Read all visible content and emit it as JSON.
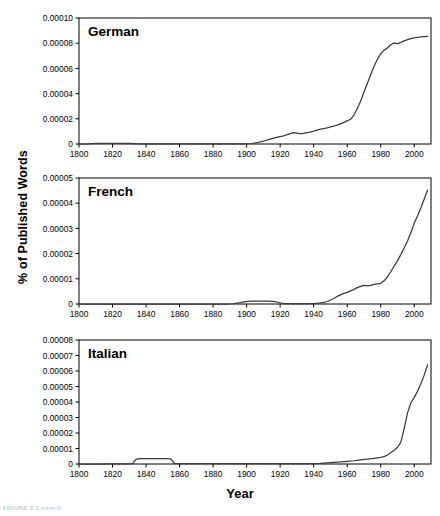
{
  "figure": {
    "caption": "FIGURE 2.1  cont'd",
    "ylabel": "% of Published Words",
    "xlabel": "Year"
  },
  "chart_data": [
    {
      "type": "line",
      "title": "German",
      "xlabel": "Year",
      "ylabel": "% of Published Words",
      "xlim": [
        1800,
        2010
      ],
      "ylim": [
        0,
        0.0001
      ],
      "xticks": [
        1800,
        1820,
        1840,
        1860,
        1880,
        1900,
        1920,
        1940,
        1960,
        1980,
        2000
      ],
      "xticklabels": [
        "1800",
        "1820",
        "1840",
        "1860",
        "1880",
        "1900",
        "1920",
        "1940",
        "1960",
        "1980",
        "2000"
      ],
      "yticks": [
        0,
        2e-05,
        4e-05,
        6e-05,
        8e-05,
        0.0001
      ],
      "yticklabels": [
        "0",
        "0.00002",
        "0.00004",
        "0.00006",
        "0.00008",
        "0.00010"
      ],
      "grid": false,
      "legend": null,
      "x": [
        1800,
        1805,
        1808,
        1810,
        1814,
        1818,
        1822,
        1826,
        1830,
        1833,
        1836,
        1840,
        1845,
        1850,
        1855,
        1860,
        1865,
        1870,
        1875,
        1880,
        1885,
        1890,
        1895,
        1900,
        1903,
        1906,
        1910,
        1914,
        1918,
        1922,
        1926,
        1928,
        1930,
        1932,
        1934,
        1936,
        1938,
        1940,
        1942,
        1944,
        1946,
        1948,
        1950,
        1952,
        1954,
        1956,
        1958,
        1960,
        1962,
        1964,
        1966,
        1968,
        1970,
        1972,
        1974,
        1976,
        1978,
        1980,
        1982,
        1984,
        1986,
        1988,
        1990,
        1992,
        1994,
        1996,
        1998,
        2000,
        2002,
        2004,
        2006,
        2008
      ],
      "y": [
        0.0,
        1e-07,
        4e-07,
        5e-07,
        5e-07,
        5e-07,
        5e-07,
        5e-07,
        5e-07,
        3e-07,
        1e-07,
        1e-07,
        1e-07,
        1e-07,
        1e-07,
        1e-07,
        1e-07,
        1e-07,
        1e-07,
        1e-07,
        1e-07,
        1e-07,
        1e-07,
        2e-07,
        4e-07,
        1e-06,
        2.2e-06,
        3.8e-06,
        5.2e-06,
        6.5e-06,
        8.2e-06,
        9e-06,
        8.6e-06,
        8.2e-06,
        8.4e-06,
        9e-06,
        9.5e-06,
        1.02e-05,
        1.1e-05,
        1.18e-05,
        1.22e-05,
        1.28e-05,
        1.36e-05,
        1.42e-05,
        1.5e-05,
        1.6e-05,
        1.72e-05,
        1.84e-05,
        1.96e-05,
        2.3e-05,
        2.8e-05,
        3.4e-05,
        4.1e-05,
        4.8e-05,
        5.5e-05,
        6.15e-05,
        6.72e-05,
        7.16e-05,
        7.45e-05,
        7.62e-05,
        7.9e-05,
        8e-05,
        7.96e-05,
        8.06e-05,
        8.18e-05,
        8.28e-05,
        8.36e-05,
        8.42e-05,
        8.46e-05,
        8.5e-05,
        8.52e-05,
        8.54e-05
      ]
    },
    {
      "type": "line",
      "title": "French",
      "xlabel": "Year",
      "ylabel": "% of Published Words",
      "xlim": [
        1800,
        2010
      ],
      "ylim": [
        0,
        5e-05
      ],
      "xticks": [
        1800,
        1820,
        1840,
        1860,
        1880,
        1900,
        1920,
        1940,
        1960,
        1980,
        2000
      ],
      "xticklabels": [
        "1800",
        "1820",
        "1840",
        "1860",
        "1880",
        "1900",
        "1920",
        "1940",
        "1960",
        "1980",
        "2000"
      ],
      "yticks": [
        0,
        1e-05,
        2e-05,
        3e-05,
        4e-05,
        5e-05
      ],
      "yticklabels": [
        "0",
        "0.00001",
        "0.00002",
        "0.00003",
        "0.00004",
        "0.00005"
      ],
      "grid": false,
      "legend": null,
      "x": [
        1800,
        1810,
        1820,
        1830,
        1840,
        1850,
        1860,
        1870,
        1880,
        1888,
        1892,
        1895,
        1898,
        1901,
        1904,
        1908,
        1912,
        1916,
        1918,
        1920,
        1922,
        1924,
        1928,
        1932,
        1936,
        1940,
        1943,
        1946,
        1948,
        1950,
        1952,
        1954,
        1956,
        1958,
        1960,
        1962,
        1964,
        1966,
        1968,
        1970,
        1972,
        1974,
        1976,
        1978,
        1980,
        1982,
        1984,
        1986,
        1988,
        1990,
        1992,
        1994,
        1996,
        1998,
        2000,
        2002,
        2004,
        2006,
        2008
      ],
      "y": [
        0.0,
        0.0,
        0.0,
        0.0,
        0.0,
        0.0,
        0.0,
        0.0,
        0.0,
        0.0,
        1e-07,
        4e-07,
        8e-07,
        1e-06,
        1.1e-06,
        1.1e-06,
        1.1e-06,
        1e-06,
        8e-07,
        4e-07,
        2e-07,
        2e-07,
        2e-07,
        2e-07,
        2e-07,
        2e-07,
        3e-07,
        6e-07,
        1e-06,
        1.6e-06,
        2.2e-06,
        3e-06,
        3.6e-06,
        4.2e-06,
        4.6e-06,
        5.2e-06,
        5.8e-06,
        6.5e-06,
        7e-06,
        7.4e-06,
        7.2e-06,
        7.4e-06,
        7.8e-06,
        8e-06,
        8.2e-06,
        9.2e-06,
        1.08e-05,
        1.28e-05,
        1.5e-05,
        1.72e-05,
        1.96e-05,
        2.22e-05,
        2.5e-05,
        2.84e-05,
        3.2e-05,
        3.5e-05,
        3.82e-05,
        4.18e-05,
        4.52e-05
      ]
    },
    {
      "type": "line",
      "title": "Italian",
      "xlabel": "Year",
      "ylabel": "% of Published Words",
      "xlim": [
        1800,
        2010
      ],
      "ylim": [
        0,
        8e-05
      ],
      "xticks": [
        1800,
        1820,
        1840,
        1860,
        1880,
        1900,
        1920,
        1940,
        1960,
        1980,
        2000
      ],
      "xticklabels": [
        "1800",
        "1820",
        "1840",
        "1860",
        "1880",
        "1900",
        "1920",
        "1940",
        "1960",
        "1980",
        "2000"
      ],
      "yticks": [
        0,
        1e-05,
        2e-05,
        3e-05,
        4e-05,
        5e-05,
        6e-05,
        7e-05,
        8e-05
      ],
      "yticklabels": [
        "0",
        "0.00001",
        "0.00002",
        "0.00003",
        "0.00004",
        "0.00005",
        "0.00006",
        "0.00007",
        "0.00008"
      ],
      "grid": false,
      "legend": null,
      "x": [
        1800,
        1810,
        1820,
        1828,
        1832,
        1834,
        1836,
        1840,
        1845,
        1850,
        1853,
        1855,
        1857,
        1860,
        1870,
        1880,
        1890,
        1900,
        1910,
        1920,
        1930,
        1938,
        1944,
        1948,
        1952,
        1956,
        1960,
        1964,
        1968,
        1972,
        1976,
        1980,
        1982,
        1984,
        1986,
        1988,
        1990,
        1992,
        1994,
        1996,
        1998,
        2000,
        2002,
        2004,
        2006,
        2008
      ],
      "y": [
        0.0,
        0.0,
        1e-07,
        1e-07,
        2e-07,
        3e-06,
        3.4e-06,
        3.4e-06,
        3.4e-06,
        3.4e-06,
        3.4e-06,
        3.2e-06,
        2e-07,
        2e-07,
        2e-07,
        2e-07,
        2e-07,
        2e-07,
        2e-07,
        2e-07,
        2e-07,
        2e-07,
        4e-07,
        7e-07,
        1e-06,
        1.3e-06,
        1.7e-06,
        2.1e-06,
        2.6e-06,
        3.1e-06,
        3.6e-06,
        4.3e-06,
        4.8e-06,
        5.8e-06,
        7.2e-06,
        8.8e-06,
        1.08e-05,
        1.4e-05,
        2.3e-05,
        3.3e-05,
        3.95e-05,
        4.3e-05,
        4.7e-05,
        5.2e-05,
        5.75e-05,
        6.4e-05
      ]
    }
  ]
}
